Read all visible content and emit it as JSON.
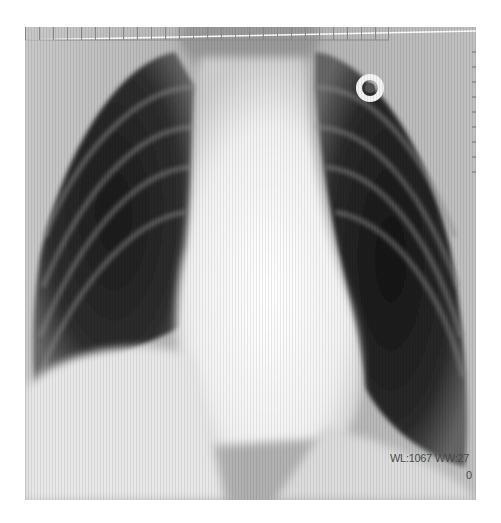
{
  "image": {
    "type": "chest-xray-pa",
    "background_color": "#ffffff",
    "film_region": {
      "x": 25,
      "y": 27,
      "width": 451,
      "height": 473
    },
    "annotations": {
      "window_level_text": "WL:1067 WW:27",
      "second_line_text": "0"
    },
    "markers": [
      {
        "name": "ring-marker",
        "x": 370,
        "y": 88,
        "outer_radius": 14,
        "inner_radius": 6
      }
    ],
    "ruler": {
      "ticks": 27,
      "x_start": 74,
      "x_end": 438,
      "baseline_y": 495
    }
  }
}
